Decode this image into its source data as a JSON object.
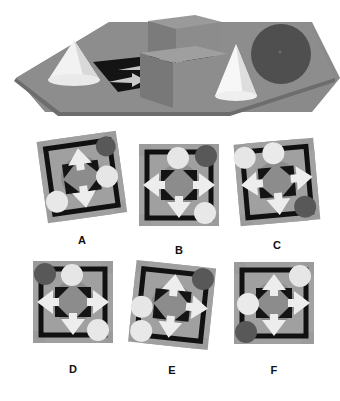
{
  "task": {
    "type": "spatial-perspective-matching",
    "title": "Spatial reasoning item: 3D scene with six candidate plan views",
    "background_color": "#ffffff"
  },
  "scene": {
    "name": "reference-3d-scene",
    "description": "Grey ground plane in perspective holding two white cones, two grey cubes, one dark grey sphere, and four light grey arrow markers on a dark patterned floor.",
    "ground_color": "#878787",
    "ground_edge_color": "#6e6e6e",
    "cube_color": "#8a8a8a",
    "cube_shade_color": "#6b6b6b",
    "cone_color": "#f2f2f2",
    "cone_shade_color": "#bfbfbf",
    "sphere_color": "#4f4f4f",
    "arrow_color": "#c9c9c9",
    "floor_dark_color": "#141414",
    "objects": [
      {
        "name": "cone-left",
        "shape": "cone",
        "fill": "#f0f0f0"
      },
      {
        "name": "cube-back",
        "shape": "cube",
        "fill": "#8a8a8a"
      },
      {
        "name": "cube-front",
        "shape": "cube",
        "fill": "#8a8a8a"
      },
      {
        "name": "cone-right",
        "shape": "cone",
        "fill": "#f5f5f5"
      },
      {
        "name": "sphere-right",
        "shape": "sphere",
        "fill": "#4f4f4f"
      },
      {
        "name": "arrow-marker-1",
        "shape": "arrow",
        "fill": "#c9c9c9"
      },
      {
        "name": "arrow-marker-2",
        "shape": "arrow",
        "fill": "#c9c9c9"
      },
      {
        "name": "arrow-marker-3",
        "shape": "arrow",
        "fill": "#c9c9c9"
      },
      {
        "name": "arrow-marker-4",
        "shape": "arrow",
        "fill": "#c9c9c9"
      }
    ]
  },
  "palette": {
    "tile_bg": "#9a9a9a",
    "tile_inner": "#8d8d8d",
    "tile_band": "#a2a2a2",
    "black": "#111111",
    "disc_light": "#e8e8e8",
    "disc_dark": "#5a5a5a",
    "arrow_light": "#f0f0f0",
    "ring": "#848484"
  },
  "options": [
    {
      "id": "A",
      "label": "A",
      "name": "option-tile-a",
      "rotation_deg": -8,
      "discs": [
        {
          "position": "top-right",
          "tone": "dark"
        },
        {
          "position": "right",
          "tone": "light"
        },
        {
          "position": "bottom-left",
          "tone": "light"
        }
      ],
      "arrows": [
        {
          "direction": "up",
          "position": "top"
        },
        {
          "direction": "down",
          "position": "bottom"
        }
      ]
    },
    {
      "id": "B",
      "label": "B",
      "name": "option-tile-b",
      "rotation_deg": 0,
      "discs": [
        {
          "position": "top",
          "tone": "light"
        },
        {
          "position": "top-right",
          "tone": "dark"
        },
        {
          "position": "bottom-right",
          "tone": "light"
        }
      ],
      "arrows": [
        {
          "direction": "left",
          "position": "left"
        },
        {
          "direction": "right",
          "position": "right"
        },
        {
          "direction": "down",
          "position": "bottom"
        }
      ]
    },
    {
      "id": "C",
      "label": "C",
      "name": "option-tile-c",
      "rotation_deg": -5,
      "discs": [
        {
          "position": "top-left",
          "tone": "light"
        },
        {
          "position": "top",
          "tone": "light"
        },
        {
          "position": "bottom-right",
          "tone": "dark"
        }
      ],
      "arrows": [
        {
          "direction": "left",
          "position": "left"
        },
        {
          "direction": "right",
          "position": "right"
        },
        {
          "direction": "down",
          "position": "bottom"
        }
      ]
    },
    {
      "id": "D",
      "label": "D",
      "name": "option-tile-d",
      "rotation_deg": 0,
      "discs": [
        {
          "position": "top-left",
          "tone": "dark"
        },
        {
          "position": "top",
          "tone": "light"
        },
        {
          "position": "bottom-right",
          "tone": "light"
        }
      ],
      "arrows": [
        {
          "direction": "left",
          "position": "left"
        },
        {
          "direction": "right",
          "position": "right"
        },
        {
          "direction": "down",
          "position": "bottom"
        }
      ]
    },
    {
      "id": "E",
      "label": "E",
      "name": "option-tile-e",
      "rotation_deg": 6,
      "discs": [
        {
          "position": "top-right",
          "tone": "dark"
        },
        {
          "position": "left",
          "tone": "light"
        },
        {
          "position": "bottom-left",
          "tone": "light"
        }
      ],
      "arrows": [
        {
          "direction": "up",
          "position": "top"
        },
        {
          "direction": "right",
          "position": "right"
        },
        {
          "direction": "down",
          "position": "bottom"
        }
      ]
    },
    {
      "id": "F",
      "label": "F",
      "name": "option-tile-f",
      "rotation_deg": 0,
      "discs": [
        {
          "position": "top-right",
          "tone": "light"
        },
        {
          "position": "left",
          "tone": "light"
        },
        {
          "position": "bottom-left",
          "tone": "dark"
        }
      ],
      "arrows": [
        {
          "direction": "up",
          "position": "top"
        },
        {
          "direction": "right",
          "position": "right"
        },
        {
          "direction": "down",
          "position": "bottom"
        }
      ]
    }
  ]
}
